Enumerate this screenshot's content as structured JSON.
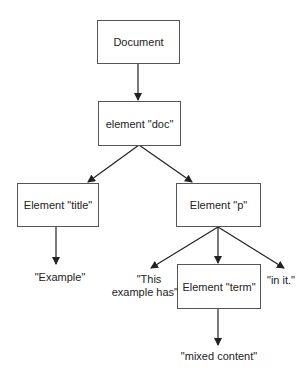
{
  "diagram": {
    "type": "tree",
    "nodes": {
      "document": {
        "label": "Document"
      },
      "doc": {
        "label": "element \"doc\""
      },
      "title": {
        "label": "Element \"title\""
      },
      "p": {
        "label": "Element \"p\""
      },
      "term": {
        "label": "Element \"term\""
      }
    },
    "text_nodes": {
      "example": "\"Example\"",
      "this_example_has_line1": "\"This",
      "this_example_has_line2": "example has\"",
      "in_it": "\"in it.\"",
      "mixed_content": "\"mixed content\""
    },
    "edges": [
      [
        "Document",
        "element \"doc\""
      ],
      [
        "element \"doc\"",
        "Element \"title\""
      ],
      [
        "element \"doc\"",
        "Element \"p\""
      ],
      [
        "Element \"title\"",
        "\"Example\""
      ],
      [
        "Element \"p\"",
        "\"This example has\""
      ],
      [
        "Element \"p\"",
        "Element \"term\""
      ],
      [
        "Element \"p\"",
        "\"in it.\""
      ],
      [
        "Element \"term\"",
        "\"mixed content\""
      ]
    ],
    "colors": {
      "line": "#222222",
      "border": "#555555",
      "background": "#ffffff"
    }
  }
}
